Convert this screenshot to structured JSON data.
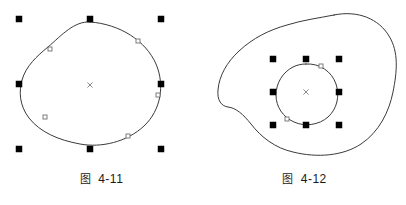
{
  "app": {
    "background_color": "#ffffff",
    "stroke_color": "#3a3a3a",
    "handle_fill": "#000000",
    "node_stroke": "#707070",
    "node_fill": "#ffffff",
    "center_marker_color": "#808080"
  },
  "figures": [
    {
      "id": "figure-4-11",
      "caption_label": "图",
      "caption_number": "4-11",
      "caption_full": "图  4-11",
      "description": "selected-curve-object-with-eight-handles",
      "selection": {
        "handle_count": 8,
        "handle_size": 6,
        "bbox": {
          "x": 19,
          "y": 19,
          "width": 142,
          "height": 130
        },
        "handles": [
          {
            "name": "handle-top-left",
            "x": 19,
            "y": 19
          },
          {
            "name": "handle-top-center",
            "x": 90,
            "y": 19
          },
          {
            "name": "handle-top-right",
            "x": 161,
            "y": 19
          },
          {
            "name": "handle-middle-left",
            "x": 19,
            "y": 84
          },
          {
            "name": "handle-middle-right",
            "x": 161,
            "y": 84
          },
          {
            "name": "handle-bottom-left",
            "x": 19,
            "y": 149
          },
          {
            "name": "handle-bottom-center",
            "x": 90,
            "y": 149
          },
          {
            "name": "handle-bottom-right",
            "x": 161,
            "y": 149
          }
        ],
        "center_marker": {
          "x": 90,
          "y": 85,
          "glyph": "x"
        }
      },
      "path": "M 90,22 C 120,24 146,41 156,64 C 165,85 161,110 144,126 C 127,142 101,148 80,144 C 58,140 40,132 29,118 C 19,105 19,91 22,80 C 26,66 37,56 48,47 C 62,35 74,21 90,22 Z",
      "nodes": [
        {
          "name": "node-upper-left",
          "x": 50,
          "y": 49
        },
        {
          "name": "node-upper-right",
          "x": 138,
          "y": 41
        },
        {
          "name": "node-right",
          "x": 158,
          "y": 95
        },
        {
          "name": "node-lower-right",
          "x": 128,
          "y": 136
        },
        {
          "name": "node-left",
          "x": 45,
          "y": 117
        }
      ]
    },
    {
      "id": "figure-4-12",
      "caption_label": "图",
      "caption_number": "4-12",
      "caption_full": "图  4-12",
      "description": "outer-blob-with-selected-inner-ellipse",
      "outer_path": "M 131,15 C 155,10 176,19 186,36 C 196,52 194,72 190,92 C 186,112 176,132 158,144 C 140,156 114,158 90,152 C 72,148 58,137 48,124 C 40,114 33,108 25,107 C 18,106 14,100 15,90 C 16,76 24,62 36,51 C 50,38 66,30 84,25 C 100,20 116,18 131,15 Z",
      "selection": {
        "handle_count": 8,
        "handle_size": 6,
        "bbox": {
          "x": 70,
          "y": 59,
          "width": 66,
          "height": 66
        },
        "handles": [
          {
            "name": "handle-top-left",
            "x": 70,
            "y": 59
          },
          {
            "name": "handle-top-center",
            "x": 103,
            "y": 59
          },
          {
            "name": "handle-top-right",
            "x": 136,
            "y": 59
          },
          {
            "name": "handle-middle-left",
            "x": 70,
            "y": 92
          },
          {
            "name": "handle-middle-right",
            "x": 136,
            "y": 92
          },
          {
            "name": "handle-bottom-left",
            "x": 70,
            "y": 125
          },
          {
            "name": "handle-bottom-center",
            "x": 103,
            "y": 125
          },
          {
            "name": "handle-bottom-right",
            "x": 136,
            "y": 125
          }
        ],
        "center_marker": {
          "x": 103,
          "y": 92,
          "glyph": "x"
        }
      },
      "inner_path": "M 103,64 C 117,63 129,72 133,84 C 137,96 134,109 125,117 C 116,125 102,127 91,122 C 80,117 73,107 73,95 C 73,83 80,72 90,67 C 94,65 98,64 103,64 Z",
      "nodes": [
        {
          "name": "node-inner-top",
          "x": 118,
          "y": 66
        },
        {
          "name": "node-inner-bottom",
          "x": 84,
          "y": 119
        }
      ]
    }
  ]
}
